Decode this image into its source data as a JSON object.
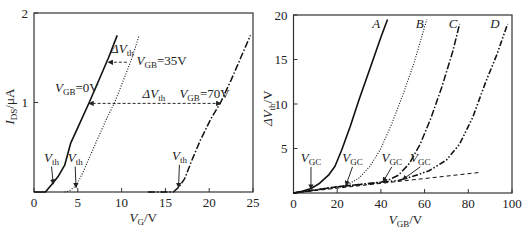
{
  "chart_data": [
    {
      "type": "line",
      "title": "",
      "xlabel": {
        "main": "V",
        "sub": "G",
        "unit": "/V"
      },
      "ylabel": {
        "main": "I",
        "sub": "DS",
        "unit": "/μA"
      },
      "xlim": [
        0,
        25
      ],
      "ylim": [
        0,
        2
      ],
      "xticks": [
        0,
        5,
        10,
        15,
        20,
        25
      ],
      "yticks": [
        1,
        2
      ],
      "grid": false,
      "series": [
        {
          "name": "VGB=0V",
          "style": "solid",
          "x": [
            0,
            1.3,
            2.0,
            2.8,
            3.5,
            4.2,
            5.0,
            6.3,
            7.5,
            8.5,
            9.5
          ],
          "y": [
            0,
            0,
            0.08,
            0.18,
            0.3,
            0.55,
            0.72,
            1.0,
            1.27,
            1.5,
            1.75
          ]
        },
        {
          "name": "VGB=35V",
          "style": "dotted",
          "x": [
            3.5,
            4.0,
            4.8,
            5.5,
            6.3,
            7.2,
            8.2,
            9.2,
            10.3,
            11.2,
            12.0
          ],
          "y": [
            0,
            0.01,
            0.07,
            0.2,
            0.38,
            0.58,
            0.8,
            1.0,
            1.27,
            1.5,
            1.75
          ]
        },
        {
          "name": "VGB=70V",
          "style": "dash-dot",
          "x": [
            13.0,
            15.9,
            16.5,
            17.2,
            18.0,
            19.0,
            20.2,
            21.3,
            22.5,
            23.6,
            24.7
          ],
          "y": [
            0,
            0,
            0.05,
            0.15,
            0.35,
            0.58,
            0.82,
            1.0,
            1.25,
            1.5,
            1.75
          ]
        }
      ],
      "annotations": [
        {
          "text": "V",
          "sub": "th",
          "target": [
            2.2,
            0.08
          ],
          "label_at": [
            2.0,
            0.34
          ]
        },
        {
          "text": "V",
          "sub": "th",
          "target": [
            4.8,
            0.04
          ],
          "label_at": [
            4.7,
            0.34
          ]
        },
        {
          "text": "V",
          "sub": "th",
          "target": [
            16.5,
            0.04
          ],
          "label_at": [
            16.6,
            0.36
          ]
        },
        {
          "text": "V",
          "sub": "GB",
          "suffix": "=0V",
          "at": [
            2.4,
            1.12
          ]
        },
        {
          "text": "V",
          "sub": "GB",
          "suffix": "=35V",
          "at": [
            11.7,
            1.42
          ]
        },
        {
          "text": "V",
          "sub": "GB",
          "suffix": "=70V",
          "at": [
            16.6,
            1.05
          ]
        },
        {
          "text": "ΔV",
          "sub": "th",
          "at": [
            8.8,
            1.55
          ]
        },
        {
          "text": "ΔV",
          "sub": "th",
          "at": [
            12.4,
            1.05
          ]
        }
      ],
      "arrows": [
        {
          "from": [
            10.6,
            1.45
          ],
          "to": [
            8.5,
            1.45
          ],
          "style": "dashed"
        },
        {
          "from": [
            21.3,
            0.99
          ],
          "to": [
            6.3,
            0.99
          ],
          "style": "dashed",
          "both_ends": true
        }
      ]
    },
    {
      "type": "line",
      "title": "",
      "xlabel": {
        "main": "V",
        "sub": "GB",
        "unit": "/V"
      },
      "ylabel": {
        "main": "ΔV",
        "sub": "th",
        "unit": "/V"
      },
      "xlim": [
        0,
        100
      ],
      "ylim": [
        0,
        20
      ],
      "xticks": [
        0,
        20,
        40,
        60,
        80,
        100
      ],
      "yticks": [
        5,
        10,
        15,
        20
      ],
      "grid": false,
      "series": [
        {
          "name": "A",
          "style": "solid",
          "x": [
            0,
            4,
            8,
            12,
            16,
            19,
            22,
            26,
            30,
            35,
            40,
            43
          ],
          "y": [
            0,
            0.2,
            0.5,
            1.1,
            2.0,
            3.0,
            4.8,
            7.5,
            10.5,
            14.0,
            17.5,
            19.5
          ]
        },
        {
          "name": "B",
          "style": "dotted",
          "x": [
            0,
            10,
            20,
            24,
            30,
            35,
            40,
            45,
            50,
            55,
            61
          ],
          "y": [
            0,
            0.3,
            0.65,
            0.8,
            1.7,
            3.0,
            5.0,
            7.8,
            11.0,
            14.5,
            19.5
          ]
        },
        {
          "name": "C",
          "style": "dash-dot",
          "x": [
            0,
            20,
            40,
            43,
            48,
            53,
            58,
            63,
            68,
            73,
            76
          ],
          "y": [
            0,
            0.7,
            1.2,
            1.4,
            2.0,
            3.3,
            5.5,
            8.5,
            12.0,
            16.0,
            19.0
          ]
        },
        {
          "name": "D",
          "style": "dash-dot-dot",
          "x": [
            0,
            20,
            40,
            48,
            55,
            62,
            70,
            76,
            82,
            88,
            93,
            98
          ],
          "y": [
            0,
            0.7,
            1.2,
            1.4,
            1.9,
            2.5,
            3.7,
            5.5,
            8.5,
            12.5,
            15.5,
            19.0
          ]
        },
        {
          "name": "linear",
          "style": "dashed",
          "x": [
            0,
            85
          ],
          "y": [
            0,
            2.3
          ]
        }
      ],
      "curve_labels": [
        {
          "text": "A",
          "at": [
            36,
            18.5
          ]
        },
        {
          "text": "B",
          "at": [
            56,
            18.5
          ]
        },
        {
          "text": "C",
          "at": [
            71,
            18.5
          ]
        },
        {
          "text": "D",
          "at": [
            90,
            18.5
          ]
        }
      ],
      "annotations": [
        {
          "text": "V",
          "sub": "GC",
          "target": [
            8,
            0.35
          ],
          "label_at": [
            8,
            3.5
          ]
        },
        {
          "text": "V",
          "sub": "GC",
          "target": [
            24,
            0.75
          ],
          "label_at": [
            27,
            3.5
          ]
        },
        {
          "text": "V",
          "sub": "GC",
          "target": [
            41,
            1.15
          ],
          "label_at": [
            45,
            3.5
          ]
        },
        {
          "text": "V",
          "sub": "GC",
          "target": [
            50,
            1.4
          ],
          "label_at": [
            58,
            3.5
          ]
        }
      ]
    }
  ]
}
